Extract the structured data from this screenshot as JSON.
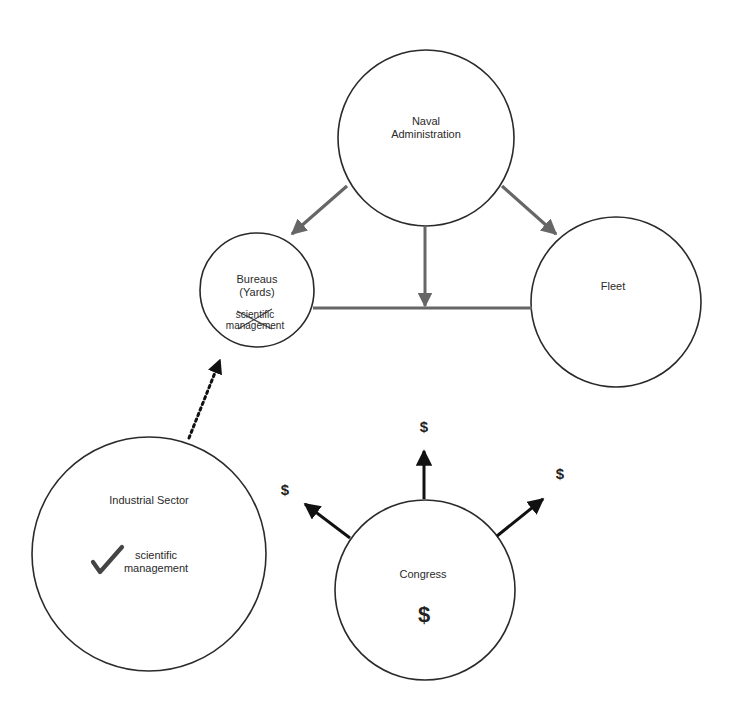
{
  "colors": {
    "background": "#ffffff",
    "circle_stroke": "#2a2a2a",
    "admin_arrow": "#666666",
    "money_arrow": "#111111",
    "text": "#2a2a2a"
  },
  "nodes": {
    "naval_administration": {
      "line1": "Naval",
      "line2": "Administration",
      "cx": 426,
      "cy": 138,
      "r": 88
    },
    "bureaus": {
      "line1": "Bureaus",
      "line2": "(Yards)",
      "note_line1": "scientific",
      "note_line2": "management",
      "note_status": "crossed-out",
      "cx": 257,
      "cy": 290,
      "r": 57
    },
    "fleet": {
      "label": "Fleet",
      "cx": 616,
      "cy": 302,
      "r": 85
    },
    "industrial_sector": {
      "label": "Industrial Sector",
      "note_line1": "scientific",
      "note_line2": "management",
      "note_icon": "checkmark-icon",
      "cx": 149,
      "cy": 554,
      "r": 117
    },
    "congress": {
      "label": "Congress",
      "symbol": "$",
      "cx": 425,
      "cy": 590,
      "r": 90
    }
  },
  "money_labels": {
    "left": "$",
    "up": "$",
    "right": "$"
  },
  "edges": [
    {
      "from": "naval_administration",
      "to": "bureaus",
      "style": "solid-gray-arrow"
    },
    {
      "from": "naval_administration",
      "to": "fleet",
      "style": "solid-gray-arrow"
    },
    {
      "from": "naval_administration",
      "to": "bureaus-fleet-link",
      "style": "solid-gray-arrow"
    },
    {
      "from": "bureaus",
      "to": "fleet",
      "style": "solid-gray-line"
    },
    {
      "from": "industrial_sector",
      "to": "bureaus",
      "style": "dotted-black-arrow"
    },
    {
      "from": "congress",
      "to": "left",
      "style": "solid-black-arrow"
    },
    {
      "from": "congress",
      "to": "up",
      "style": "solid-black-arrow"
    },
    {
      "from": "congress",
      "to": "right",
      "style": "solid-black-arrow"
    }
  ]
}
